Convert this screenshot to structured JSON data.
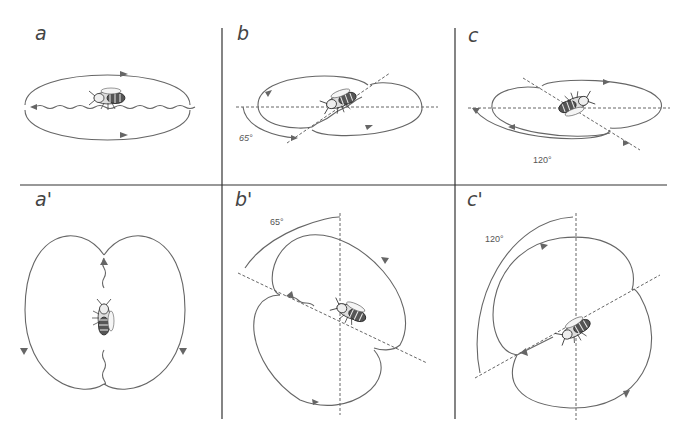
{
  "figure": {
    "panels": [
      {
        "id": "a",
        "label": "a",
        "angle": null
      },
      {
        "id": "b",
        "label": "b",
        "angle": "65°"
      },
      {
        "id": "c",
        "label": "c",
        "angle": "120°"
      },
      {
        "id": "a_prime",
        "label": "a'",
        "angle": null
      },
      {
        "id": "b_prime",
        "label": "b'",
        "angle": "65°"
      },
      {
        "id": "c_prime",
        "label": "c'",
        "angle": "120°"
      }
    ]
  },
  "colors": {
    "line": "#666666",
    "grid": "#333333",
    "background": "#ffffff"
  }
}
